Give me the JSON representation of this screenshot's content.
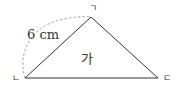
{
  "diagram": {
    "type": "triangle",
    "shape_name": "가",
    "side_length_label": "6 cm",
    "vertices": [
      {
        "label": "ㄱ",
        "x": 91,
        "y": 17
      },
      {
        "label": "ㄴ",
        "x": 25,
        "y": 78
      },
      {
        "label": "ㄷ",
        "x": 158,
        "y": 78
      }
    ],
    "colors": {
      "stroke": "#333333",
      "dashed_arc": "#999999",
      "background": "#ffffff"
    }
  }
}
